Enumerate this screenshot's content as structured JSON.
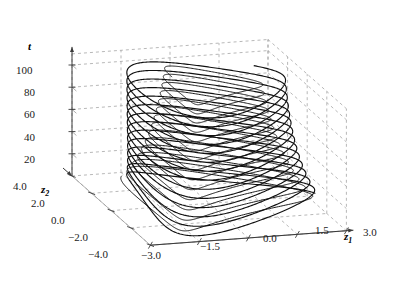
{
  "figure": {
    "type": "3d-phase-portrait",
    "background_color": "#ffffff",
    "curve_color": "#101010",
    "grid_color": "#9a9a9a",
    "axis_color": "#555555"
  },
  "axes": {
    "vertical": {
      "name": "t",
      "label_x": 28,
      "label_y": 40,
      "ticks": [
        {
          "value": "100",
          "x": 16,
          "y": 64
        },
        {
          "value": "80",
          "x": 24,
          "y": 86
        },
        {
          "value": "60",
          "x": 24,
          "y": 108
        },
        {
          "value": "40",
          "x": 24,
          "y": 131
        },
        {
          "value": "20",
          "x": 24,
          "y": 153
        }
      ]
    },
    "depth": {
      "name": "z",
      "sub": "2",
      "label_x": 41,
      "label_y": 183,
      "ticks": [
        {
          "value": "4.0",
          "x": 13,
          "y": 180
        },
        {
          "value": "2.0",
          "x": 31,
          "y": 197
        },
        {
          "value": "0.0",
          "x": 51,
          "y": 214
        },
        {
          "value": "-2.0",
          "x": 68,
          "y": 231
        },
        {
          "value": "-4.0",
          "x": 88,
          "y": 248
        }
      ]
    },
    "horizontal": {
      "name": "z",
      "sub": "1",
      "label_x": 344,
      "label_y": 230,
      "ticks": [
        {
          "value": "-3.0",
          "x": 141,
          "y": 249
        },
        {
          "value": "-1.5",
          "x": 200,
          "y": 240
        },
        {
          "value": "0.0",
          "x": 263,
          "y": 232
        },
        {
          "value": "1.5",
          "x": 315,
          "y": 224
        },
        {
          "value": "3.0",
          "x": 363,
          "y": 226
        }
      ]
    }
  },
  "chart_data": {
    "type": "line",
    "title": "",
    "xlabel": "z1",
    "ylabel": "z2",
    "zlabel": "t",
    "xlim": [
      -3.0,
      3.0
    ],
    "ylim": [
      -4.0,
      4.0
    ],
    "zlim": [
      0,
      110
    ],
    "xticks": [
      -3.0,
      -1.5,
      0.0,
      1.5,
      3.0
    ],
    "yticks": [
      4.0,
      2.0,
      0.0,
      -2.0,
      -4.0
    ],
    "zticks": [
      20,
      40,
      60,
      80,
      100
    ],
    "grid": true,
    "legend": null,
    "series": [
      {
        "name": "limit-cycle trajectory",
        "description": "Oscillatory orbit of (z1,z2) plotted against time t, tracing roughly 14 revolutions between t=0 and t=110, converging onto a limit cycle of radius ~2.2 in z1 and ~3.2 in z2.",
        "color": "#101010",
        "revolutions": 14,
        "t_start": 0,
        "t_end": 110,
        "period": 7.8,
        "r1_start": 2.6,
        "r1_end": 2.15,
        "r2_start": 3.6,
        "r2_end": 3.1,
        "inner_loop_ratio": 0.42,
        "inner_phase": 2.1
      }
    ]
  }
}
